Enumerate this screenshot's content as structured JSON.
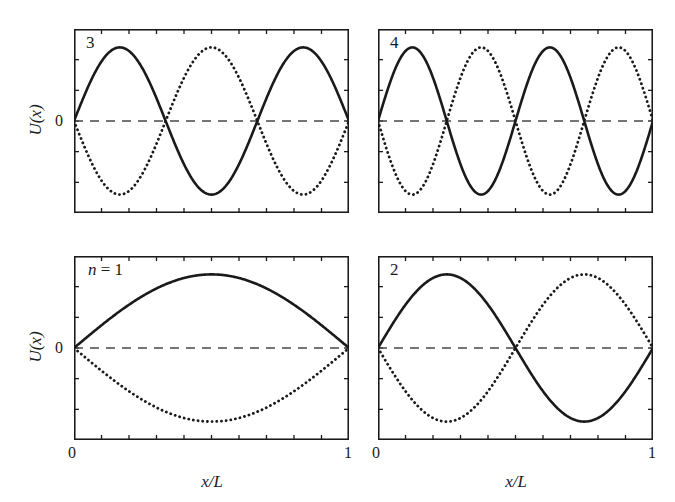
{
  "figure": {
    "background_color": "#ffffff",
    "line_color": "#1a1a1a",
    "zero_line_color": "#4a4a4a"
  },
  "axes": {
    "ylabel": "U(x)",
    "xlabel": "x/L",
    "ytick_zero": "0",
    "xtick_left": "0",
    "xtick_right": "1"
  },
  "panels": {
    "top_left": {
      "label": "3"
    },
    "top_right": {
      "label": "4"
    },
    "bottom_left": {
      "label_prefix": "n",
      "label_eq": " = ",
      "label_value": "1",
      "label_full": "n = 1"
    },
    "bottom_right": {
      "label": "2"
    }
  },
  "chart_data": [
    {
      "type": "line",
      "title": "",
      "panel": "bottom_left",
      "xlabel": "x/L",
      "ylabel": "U(x)",
      "xlim": [
        0,
        1
      ],
      "ylim": [
        -1,
        1
      ],
      "xticks": [
        0,
        0.1,
        0.2,
        0.3,
        0.4,
        0.5,
        0.6,
        0.7,
        0.8,
        0.9,
        1
      ],
      "xticklabels": [
        "0",
        "",
        "",
        "",
        "",
        "",
        "",
        "",
        "",
        "",
        "1"
      ],
      "yticks": [
        -1,
        -0.667,
        -0.333,
        0,
        0.333,
        0.667,
        1
      ],
      "yticklabels": [
        "",
        "",
        "",
        "0",
        "",
        "",
        ""
      ],
      "grid": false,
      "legend": false,
      "mode_n": 1,
      "annotations": [
        "n = 1"
      ],
      "series": [
        {
          "name": "solid",
          "style": "solid",
          "formula": "0.80*sin(1*pi*x)",
          "amplitude": 0.8,
          "phase_sign": 1
        },
        {
          "name": "dotted",
          "style": "dotted",
          "formula": "-0.80*sin(1*pi*x)",
          "amplitude": 0.8,
          "phase_sign": -1
        },
        {
          "name": "zero",
          "style": "dashed",
          "formula": "0",
          "amplitude": 0,
          "phase_sign": 0
        }
      ]
    },
    {
      "type": "line",
      "title": "",
      "panel": "bottom_right",
      "xlabel": "x/L",
      "ylabel": "",
      "xlim": [
        0,
        1
      ],
      "ylim": [
        -1,
        1
      ],
      "xticks": [
        0,
        0.1,
        0.2,
        0.3,
        0.4,
        0.5,
        0.6,
        0.7,
        0.8,
        0.9,
        1
      ],
      "xticklabels": [
        "0",
        "",
        "",
        "",
        "",
        "",
        "",
        "",
        "",
        "",
        "1"
      ],
      "yticks": [
        -1,
        -0.667,
        -0.333,
        0,
        0.333,
        0.667,
        1
      ],
      "yticklabels": [
        "",
        "",
        "",
        "",
        "",
        "",
        ""
      ],
      "grid": false,
      "legend": false,
      "mode_n": 2,
      "annotations": [
        "2"
      ],
      "series": [
        {
          "name": "solid",
          "style": "solid",
          "formula": "0.80*sin(2*pi*x)",
          "amplitude": 0.8,
          "phase_sign": 1
        },
        {
          "name": "dotted",
          "style": "dotted",
          "formula": "-0.80*sin(2*pi*x)",
          "amplitude": 0.8,
          "phase_sign": -1
        },
        {
          "name": "zero",
          "style": "dashed",
          "formula": "0",
          "amplitude": 0,
          "phase_sign": 0
        }
      ]
    },
    {
      "type": "line",
      "title": "",
      "panel": "top_left",
      "xlabel": "",
      "ylabel": "U(x)",
      "xlim": [
        0,
        1
      ],
      "ylim": [
        -1,
        1
      ],
      "xticks": [
        0,
        0.1,
        0.2,
        0.3,
        0.4,
        0.5,
        0.6,
        0.7,
        0.8,
        0.9,
        1
      ],
      "xticklabels": [
        "",
        "",
        "",
        "",
        "",
        "",
        "",
        "",
        "",
        "",
        ""
      ],
      "yticks": [
        -1,
        -0.667,
        -0.333,
        0,
        0.333,
        0.667,
        1
      ],
      "yticklabels": [
        "",
        "",
        "",
        "0",
        "",
        "",
        ""
      ],
      "grid": false,
      "legend": false,
      "mode_n": 3,
      "annotations": [
        "3"
      ],
      "series": [
        {
          "name": "solid",
          "style": "solid",
          "formula": "0.80*sin(3*pi*x)",
          "amplitude": 0.8,
          "phase_sign": 1
        },
        {
          "name": "dotted",
          "style": "dotted",
          "formula": "-0.80*sin(3*pi*x)",
          "amplitude": 0.8,
          "phase_sign": -1
        },
        {
          "name": "zero",
          "style": "dashed",
          "formula": "0",
          "amplitude": 0,
          "phase_sign": 0
        }
      ]
    },
    {
      "type": "line",
      "title": "",
      "panel": "top_right",
      "xlabel": "",
      "ylabel": "",
      "xlim": [
        0,
        1
      ],
      "ylim": [
        -1,
        1
      ],
      "xticks": [
        0,
        0.1,
        0.2,
        0.3,
        0.4,
        0.5,
        0.6,
        0.7,
        0.8,
        0.9,
        1
      ],
      "xticklabels": [
        "",
        "",
        "",
        "",
        "",
        "",
        "",
        "",
        "",
        "",
        ""
      ],
      "yticks": [
        -1,
        -0.667,
        -0.333,
        0,
        0.333,
        0.667,
        1
      ],
      "yticklabels": [
        "",
        "",
        "",
        "",
        "",
        "",
        ""
      ],
      "grid": false,
      "legend": false,
      "mode_n": 4,
      "annotations": [
        "4"
      ],
      "series": [
        {
          "name": "solid",
          "style": "solid",
          "formula": "0.80*sin(4*pi*x)",
          "amplitude": 0.8,
          "phase_sign": 1
        },
        {
          "name": "dotted",
          "style": "dotted",
          "formula": "-0.80*sin(4*pi*x)",
          "amplitude": 0.8,
          "phase_sign": -1
        },
        {
          "name": "zero",
          "style": "dashed",
          "formula": "0",
          "amplitude": 0,
          "phase_sign": 0
        }
      ]
    }
  ]
}
